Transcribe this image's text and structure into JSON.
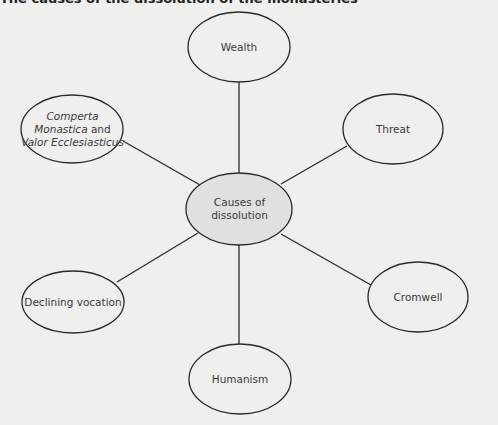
{
  "caption": "The causes of the dissolution of the monasteries",
  "colors": {
    "background": "#efefee",
    "center_fill": "#e0e0e0",
    "node_fill": "#efefee",
    "stroke": "#2a2a2a",
    "text": "#3a3a3a"
  },
  "center": {
    "line1": "Causes of",
    "line2": "dissolution"
  },
  "nodes": {
    "wealth": {
      "label": "Wealth"
    },
    "threat": {
      "label": "Threat"
    },
    "cromwell": {
      "label": "Cromwell"
    },
    "humanism": {
      "label": "Humanism"
    },
    "declining": {
      "label": "Declining vocation"
    },
    "comperta": {
      "line1": "Comperta",
      "line2_italic": "Monastica",
      "line2_plain": " and",
      "line3": "Valor Ecclesiasticus"
    }
  }
}
